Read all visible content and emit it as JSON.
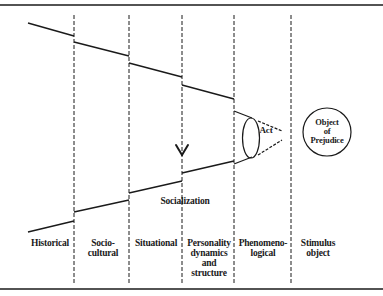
{
  "diagram": {
    "type": "funnel-of-causation",
    "columns": [
      {
        "label_lines": [
          "Historical"
        ]
      },
      {
        "label_lines": [
          "Socio-",
          "cultural"
        ]
      },
      {
        "label_lines": [
          "Situational"
        ]
      },
      {
        "label_lines": [
          "Personality",
          "dynamics",
          "and",
          "structure"
        ]
      },
      {
        "label_lines": [
          "Phenomeno-",
          "logical"
        ]
      },
      {
        "label_lines": [
          "Stimulus",
          "object"
        ]
      }
    ],
    "annotations": {
      "socialization": "Socialization",
      "act": "Act",
      "object_lines": [
        "Object",
        "of",
        "Prejudice"
      ]
    },
    "colors": {
      "line": "#1a1a1a",
      "background": "#ffffff"
    }
  }
}
